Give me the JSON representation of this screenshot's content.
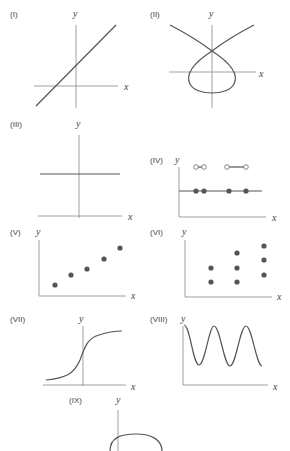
{
  "colors": {
    "curve": "#555555",
    "axis": "#888888",
    "background": "#ffffff"
  },
  "graphs": [
    {
      "id": "I",
      "label": "(I)",
      "xlabel": "x",
      "ylabel": "y",
      "description": "straight line with positive slope and positive y-intercept"
    },
    {
      "id": "II",
      "label": "(II)",
      "xlabel": "x",
      "ylabel": "y",
      "description": "self-intersecting loop curve crossing itself on the y-axis"
    },
    {
      "id": "III",
      "label": "(III)",
      "xlabel": "x",
      "ylabel": "y",
      "description": "horizontal line (constant function)"
    },
    {
      "id": "IV",
      "label": "(IV)",
      "xlabel": "x",
      "ylabel": "y",
      "description": "step-like function with filled dots on a horizontal line and open dots above"
    },
    {
      "id": "V",
      "label": "(V)",
      "xlabel": "x",
      "ylabel": "y",
      "description": "five points increasing roughly linearly"
    },
    {
      "id": "VI",
      "label": "(VI)",
      "xlabel": "x",
      "ylabel": "y",
      "description": "points in vertical columns: 2, 3, 3 points at three x-values"
    },
    {
      "id": "VII",
      "label": "(VII)",
      "xlabel": "x",
      "ylabel": "y",
      "description": "sigmoid / S-shaped increasing curve"
    },
    {
      "id": "VIII",
      "label": "(VIII)",
      "xlabel": "x",
      "ylabel": "y",
      "description": "periodic sinusoidal wave"
    },
    {
      "id": "IX",
      "label": "(IX)",
      "xlabel": "x",
      "ylabel": "y",
      "description": "upper arc of an ellipse/circle crossing the y-axis (cropped)"
    }
  ]
}
